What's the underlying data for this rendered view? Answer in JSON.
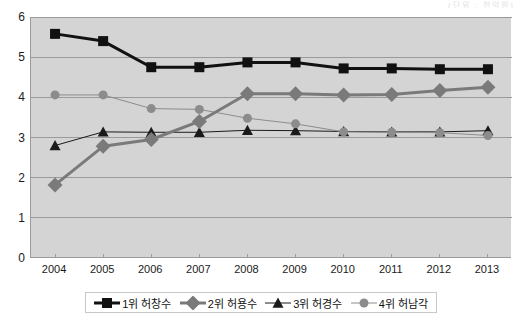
{
  "top_caption": "(단위 : 천억원)",
  "chart_data": {
    "type": "line",
    "title": "",
    "subtitle": "",
    "xlabel": "",
    "ylabel": "",
    "categories": [
      "2004",
      "2005",
      "2006",
      "2007",
      "2008",
      "2009",
      "2010",
      "2011",
      "2012",
      "2013"
    ],
    "ylim": [
      0,
      6
    ],
    "ytick_values": [
      0,
      1,
      2,
      3,
      4,
      5,
      6
    ],
    "ytick_labels": [
      "0",
      "1",
      "2",
      "3",
      "4",
      "5",
      "6"
    ],
    "grid": true,
    "grid_axis": "y",
    "legend_position": "bottom",
    "plot_background": "#d4d4d4",
    "series": [
      {
        "name": "1위 허창수",
        "rank": "1위",
        "person": "허창수",
        "marker": "square",
        "color": "#111111",
        "line_width": 3,
        "values": [
          5.58,
          5.4,
          4.75,
          4.75,
          4.87,
          4.87,
          4.72,
          4.72,
          4.7,
          4.7
        ]
      },
      {
        "name": "2위 허용수",
        "rank": "2위",
        "person": "허용수",
        "marker": "diamond",
        "color": "#7a7a7a",
        "line_width": 3,
        "values": [
          1.82,
          2.78,
          2.95,
          3.4,
          4.09,
          4.09,
          4.06,
          4.07,
          4.17,
          4.25
        ]
      },
      {
        "name": "3위 허경수",
        "rank": "3위",
        "person": "허경수",
        "marker": "triangle",
        "color": "#1a1a1a",
        "line_width": 1,
        "values": [
          2.8,
          3.14,
          3.13,
          3.13,
          3.18,
          3.17,
          3.15,
          3.14,
          3.14,
          3.17
        ]
      },
      {
        "name": "4위 허남각",
        "rank": "4위",
        "person": "허남각",
        "marker": "circle",
        "color": "#8c8c8c",
        "line_width": 1,
        "values": [
          4.06,
          4.06,
          3.72,
          3.7,
          3.48,
          3.34,
          3.14,
          3.13,
          3.12,
          3.05
        ]
      }
    ]
  }
}
